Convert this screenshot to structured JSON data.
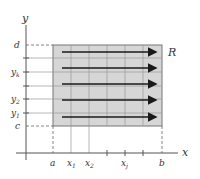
{
  "diagram": {
    "axes": {
      "x_label": "x",
      "y_label": "y"
    },
    "region_label": "R",
    "x_ticks": [
      {
        "label": "a",
        "sub": ""
      },
      {
        "label": "x",
        "sub": "1"
      },
      {
        "label": "x",
        "sub": "2"
      },
      {
        "label": "x",
        "sub": "j"
      },
      {
        "label": "b",
        "sub": ""
      }
    ],
    "y_ticks": [
      {
        "label": "d",
        "sub": ""
      },
      {
        "label": "y",
        "sub": "k"
      },
      {
        "label": "y",
        "sub": "2"
      },
      {
        "label": "y",
        "sub": "1"
      },
      {
        "label": "c",
        "sub": ""
      }
    ],
    "arrow_count": 5,
    "colors": {
      "region_fill": "#d6d6d6",
      "grid": "#999999",
      "arrow": "#1a1a1a",
      "axis": "#555555"
    }
  }
}
